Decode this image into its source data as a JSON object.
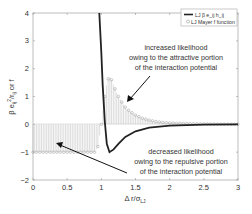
{
  "chart_data": {
    "type": "line",
    "title": "",
    "xlabel": "Δ r/σ_LJ",
    "ylabel": "β e_ij²/r_ij or f",
    "xlim": [
      0,
      3
    ],
    "ylim": [
      -2,
      4
    ],
    "xticks": [
      0,
      0.5,
      1,
      1.5,
      2,
      2.5,
      3
    ],
    "xtick_labels": [
      "0",
      "0.5",
      "1",
      "1.5",
      "2",
      "2.5",
      "3"
    ],
    "yticks": [
      -2,
      -1,
      0,
      1,
      2,
      3,
      4
    ],
    "ytick_labels": [
      "−2",
      "−1",
      "0",
      "1",
      "2",
      "3",
      "4"
    ],
    "grid": false,
    "legend_position": "upper right",
    "series": [
      {
        "name": "LJ β e_ij h_ij",
        "style": "solid black line",
        "x": [
          0.97,
          1.0,
          1.02,
          1.05,
          1.08,
          1.12,
          1.18,
          1.25,
          1.35,
          1.5,
          1.7,
          2.0,
          2.5,
          3.0
        ],
        "y": [
          4.0,
          2.6,
          1.4,
          0.1,
          -0.7,
          -1.0,
          -0.9,
          -0.7,
          -0.45,
          -0.25,
          -0.12,
          -0.05,
          -0.01,
          0.0
        ]
      },
      {
        "name": "LJ Mayer f function",
        "style": "grey circles with stems",
        "x": [
          0.0,
          0.1,
          0.2,
          0.3,
          0.4,
          0.5,
          0.6,
          0.7,
          0.8,
          0.9,
          0.95,
          1.0,
          1.03,
          1.06,
          1.09,
          1.12,
          1.15,
          1.18,
          1.22,
          1.26,
          1.3,
          1.35,
          1.4,
          1.5,
          1.6,
          1.7,
          1.8,
          1.9,
          2.0,
          2.2,
          2.4,
          2.6,
          2.8,
          3.0
        ],
        "y": [
          -1.0,
          -1.0,
          -1.0,
          -1.0,
          -1.0,
          -1.0,
          -1.0,
          -1.0,
          -1.0,
          -1.0,
          -0.8,
          0.0,
          0.6,
          1.2,
          1.6,
          1.7,
          1.6,
          1.4,
          1.15,
          0.95,
          0.8,
          0.62,
          0.5,
          0.33,
          0.22,
          0.15,
          0.1,
          0.07,
          0.05,
          0.03,
          0.02,
          0.01,
          0.005,
          0.0
        ]
      }
    ],
    "annotations": [
      {
        "lines": [
          "increased likelihood",
          "owing to the attractive portion",
          "of the interaction potential"
        ],
        "arrow_to": [
          1.2,
          0.9
        ]
      },
      {
        "lines": [
          "decreased likelihood",
          "owing to the repulsive portion",
          "of the interaction potential"
        ],
        "arrow_to": [
          0.4,
          -0.75
        ]
      }
    ]
  },
  "legend": {
    "items": [
      {
        "label": "LJ β e_ij h_ij"
      },
      {
        "label": "LJ Mayer f function"
      }
    ]
  },
  "annotation_top": {
    "line1": "increased likelihood",
    "line2": "owing to the attractive portion",
    "line3": "of the interaction potential"
  },
  "annotation_bottom": {
    "line1": "decreased likelihood",
    "line2": "owing to the repulsive portion",
    "line3": "of the interaction potential"
  },
  "axes": {
    "xlabel": "Δ r/σ",
    "xlabel_sub": "LJ",
    "ylabel": "β e",
    "ylabel_tail": "/r",
    "ylabel_end": " or f"
  }
}
